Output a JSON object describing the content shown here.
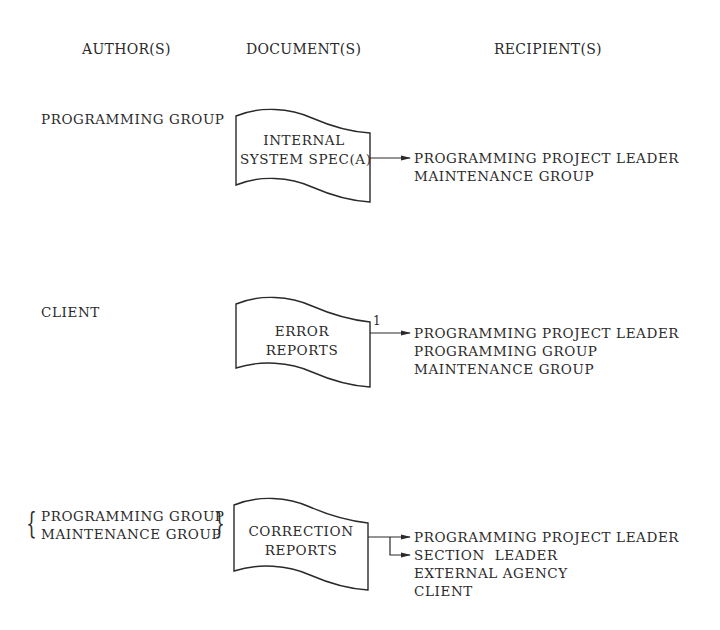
{
  "headers": {
    "authors": "AUTHOR(S)",
    "documents": "DOCUMENT(S)",
    "recipients": "RECIPIENT(S)"
  },
  "rows": [
    {
      "authors": [
        "PROGRAMMING GROUP"
      ],
      "document": {
        "line1": "INTERNAL",
        "line2": "SYSTEM SPEC(A)"
      },
      "connector_label": "",
      "recipients": [
        "PROGRAMMING PROJECT LEADER",
        "MAINTENANCE GROUP"
      ]
    },
    {
      "authors": [
        "CLIENT"
      ],
      "document": {
        "line1": "ERROR",
        "line2": "REPORTS"
      },
      "connector_label": "1",
      "recipients": [
        "PROGRAMMING PROJECT LEADER",
        "PROGRAMMING GROUP",
        "MAINTENANCE GROUP"
      ]
    },
    {
      "authors": [
        "PROGRAMMING GROUP",
        "MAINTENANCE GROUP"
      ],
      "document": {
        "line1": "CORRECTION",
        "line2": "REPORTS"
      },
      "connector_label": "",
      "recipients": [
        "PROGRAMMING PROJECT LEADER",
        "SECTION  LEADER",
        "EXTERNAL AGENCY",
        "CLIENT"
      ]
    }
  ]
}
